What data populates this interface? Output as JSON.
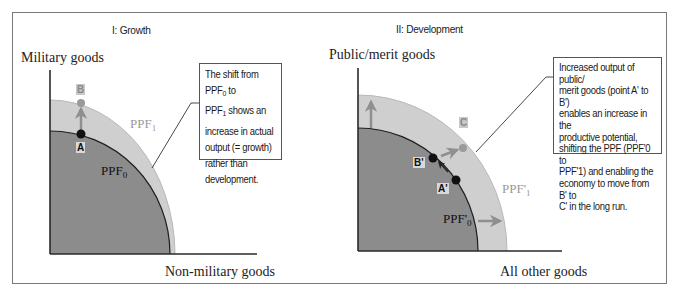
{
  "panels": [
    {
      "id": "growth",
      "title": "I: Growth",
      "y_axis_label": "Military goods",
      "x_axis_label": "Non-military goods",
      "curves": [
        {
          "name": "PPF",
          "sub": "0",
          "label": "PPF0",
          "role": "original"
        },
        {
          "name": "PPF",
          "sub": "1",
          "label": "PPF1",
          "role": "shifted"
        }
      ],
      "points": [
        {
          "label": "A",
          "on": "PPF0"
        },
        {
          "label": "B",
          "on": "PPF1"
        }
      ],
      "arrows": [
        "A to B (upward)"
      ],
      "callout": {
        "line1_pre": "The shift from PPF",
        "line1_sub": "0",
        "line1_post": " to",
        "line2_pre": "PPF",
        "line2_sub": "1",
        "line2_post": " shows an",
        "rest": [
          "increase in actual",
          "output (= growth)",
          "rather than",
          "development."
        ],
        "full_text": "The shift from PPF0 to PPF1 shows an increase in actual output (= growth) rather than development."
      }
    },
    {
      "id": "development",
      "title": "II: Development",
      "y_axis_label": "Public/merit goods",
      "x_axis_label": "All other goods",
      "curves": [
        {
          "name": "PPF'",
          "sub": "0",
          "label": "PPF'0",
          "role": "original"
        },
        {
          "name": "PPF'",
          "sub": "1",
          "label": "PPF'1",
          "role": "shifted"
        }
      ],
      "points": [
        {
          "label": "A'",
          "on": "PPF'0"
        },
        {
          "label": "B'",
          "on": "PPF'0"
        },
        {
          "label": "C",
          "on": "PPF'1"
        }
      ],
      "arrows": [
        "A' to B' (along PPF'0)",
        "B' to C (outward)",
        "upward shift arrow",
        "rightward shift arrow"
      ],
      "callout": {
        "lines": [
          "Increased output of public/",
          "merit goods (point A' to B')",
          "enables an increase in the",
          "productive potential,",
          "shifting the PPF (PPF'0 to",
          "PPF'1) and enabling the",
          "economy to move from B' to",
          "C' in the long run."
        ],
        "full_text": "Increased output of public/merit goods (point A' to B') enables an increase in the productive potential, shifting the PPF (PPF'0 to PPF'1) and enabling the economy to move from B' to C' in the long run."
      }
    }
  ],
  "colors": {
    "inner_fill": "#8c8c8c",
    "outer_fill": "#cfcfcf",
    "axis": "#2a2a2a",
    "frame": "#7a7a7a",
    "arrow_gray": "#8f8f8f",
    "point_dark": "#111111",
    "point_gray": "#9a9a9a",
    "shifted_label": "#9a9a9a"
  }
}
